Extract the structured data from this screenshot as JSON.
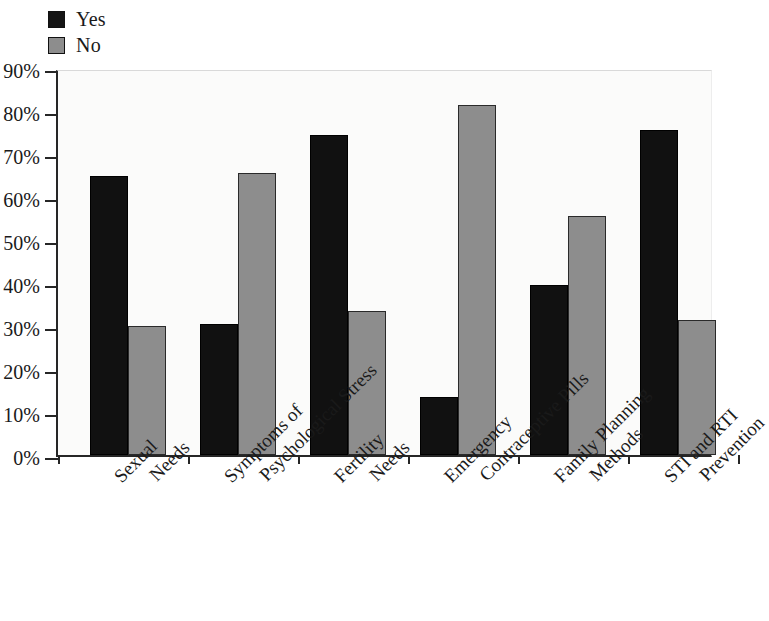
{
  "legend": {
    "position": "top-left",
    "entries": [
      {
        "label": "Yes",
        "color": "#111111",
        "icon": "legend-swatch-black"
      },
      {
        "label": "No",
        "color": "#8d8d8d",
        "icon": "legend-swatch-gray"
      }
    ]
  },
  "axes": {
    "y_ticks": [
      "0%",
      "10%",
      "20%",
      "30%",
      "40%",
      "50%",
      "60%",
      "70%",
      "80%",
      "90%"
    ],
    "y_min": 0,
    "y_max": 90,
    "y_step": 10,
    "grid": false
  },
  "chart_data": {
    "type": "bar",
    "title": "",
    "subtitle": "",
    "xlabel": "",
    "ylabel": "",
    "ylim": [
      0,
      90
    ],
    "ytick_labels": [
      "0%",
      "10%",
      "20%",
      "30%",
      "40%",
      "50%",
      "60%",
      "70%",
      "80%",
      "90%"
    ],
    "grid": false,
    "legend_position": "top-left",
    "categories": [
      "Sexual Needs",
      "Symptoms of Psychological Stress",
      "Fertility Needs",
      "Emergency Contraceptive Pills",
      "Family Planning Methods",
      "STI and RTI Prevention"
    ],
    "category_lines": [
      [
        "Sexual",
        "Needs"
      ],
      [
        "Symptoms of",
        "Psychological Stress"
      ],
      [
        "Fertility",
        "Needs"
      ],
      [
        "Emergency",
        "Contraceptive Pills"
      ],
      [
        "Family Planning",
        "Methods"
      ],
      [
        "STI and RTI",
        "Prevention"
      ]
    ],
    "series": [
      {
        "name": "Yes",
        "color": "#111111",
        "values": [
          65.0,
          30.5,
          74.5,
          13.5,
          39.5,
          75.5
        ]
      },
      {
        "name": "No",
        "color": "#8d8d8d",
        "values": [
          30.0,
          65.5,
          33.5,
          81.5,
          55.5,
          31.5
        ]
      }
    ]
  }
}
